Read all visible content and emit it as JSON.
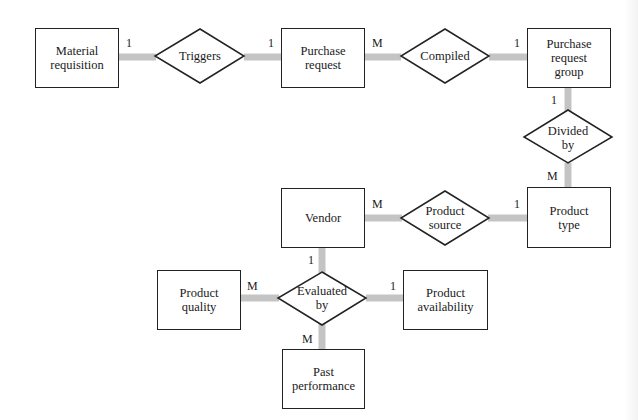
{
  "diagram": {
    "type": "entity-relationship",
    "entities": [
      {
        "id": "material_requisition",
        "label": "Material requisition"
      },
      {
        "id": "purchase_request",
        "label": "Purchase request"
      },
      {
        "id": "purchase_request_group",
        "label": "Purchase request group"
      },
      {
        "id": "product_type",
        "label": "Product type"
      },
      {
        "id": "vendor",
        "label": "Vendor"
      },
      {
        "id": "product_quality",
        "label": "Product quality"
      },
      {
        "id": "product_availability",
        "label": "Product availability"
      },
      {
        "id": "past_performance",
        "label": "Past performance"
      }
    ],
    "relationships": [
      {
        "id": "triggers",
        "label": "Triggers",
        "from": "material_requisition",
        "from_card": "1",
        "to": "purchase_request",
        "to_card": "1"
      },
      {
        "id": "compiled",
        "label": "Compiled",
        "from": "purchase_request",
        "from_card": "M",
        "to": "purchase_request_group",
        "to_card": "1"
      },
      {
        "id": "divided_by",
        "label": "Divided by",
        "from": "purchase_request_group",
        "from_card": "1",
        "to": "product_type",
        "to_card": "M"
      },
      {
        "id": "product_source",
        "label": "Product source",
        "from": "vendor",
        "from_card": "M",
        "to": "product_type",
        "to_card": "1"
      },
      {
        "id": "evaluated_by",
        "label": "Evaluated by",
        "vendor_card": "1",
        "product_quality_card": "M",
        "product_availability_card": "1",
        "past_performance_card": "M"
      }
    ],
    "colors": {
      "connector": "#c4c4c4",
      "outline": "#222222",
      "fill": "#ffffff"
    }
  }
}
